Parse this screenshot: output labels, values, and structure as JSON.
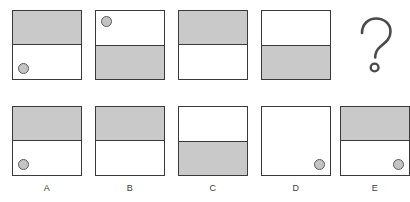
{
  "puzzle": {
    "title": "matrix-reasoning-item",
    "colors": {
      "gray_fill": "#c9c9c9",
      "outline": "#3a3a3a",
      "dot_fill": "#c4c4c4",
      "dot_outline": "#5a5a5a",
      "background": "#ffffff",
      "label_text": "#3c3c3c"
    },
    "question_row": {
      "name": "stimulus-row",
      "cells": [
        {
          "id": "stim-1",
          "shaded_half": "top",
          "dot": "bottom-left",
          "description": "square with shaded top half and a dot in the lower-left"
        },
        {
          "id": "stim-2",
          "shaded_half": "bottom",
          "dot": "top-left",
          "description": "square with shaded bottom half and a dot in the upper-left"
        },
        {
          "id": "stim-3",
          "shaded_half": "top",
          "dot": "none",
          "description": "square with shaded top half and no dot"
        },
        {
          "id": "stim-4",
          "shaded_half": "bottom",
          "dot": "none",
          "description": "square with shaded bottom half and no dot"
        }
      ],
      "missing_cell": {
        "id": "stim-5",
        "icon": "question-mark-icon",
        "label": "?"
      }
    },
    "answer_row": {
      "name": "answer-options-row",
      "options": [
        {
          "label": "A",
          "shaded_half": "top",
          "dot": "bottom-left",
          "description": "shaded top half with a dot in the lower-left"
        },
        {
          "label": "B",
          "shaded_half": "top",
          "dot": "none",
          "description": "shaded top half with no dot"
        },
        {
          "label": "C",
          "shaded_half": "bottom",
          "dot": "none",
          "description": "shaded bottom half with no dot"
        },
        {
          "label": "D",
          "shaded_half": "none",
          "dot": "bottom-right",
          "description": "all white with a dot in the lower-right"
        },
        {
          "label": "E",
          "shaded_half": "top",
          "dot": "bottom-right",
          "description": "shaded top half with a dot in the lower-right"
        }
      ]
    },
    "layout": {
      "columns_x": [
        12,
        95,
        178,
        261,
        340
      ],
      "question_row_y": 10,
      "answer_row_y": 106,
      "answer_label_y": 183,
      "cell_size": 70
    }
  }
}
